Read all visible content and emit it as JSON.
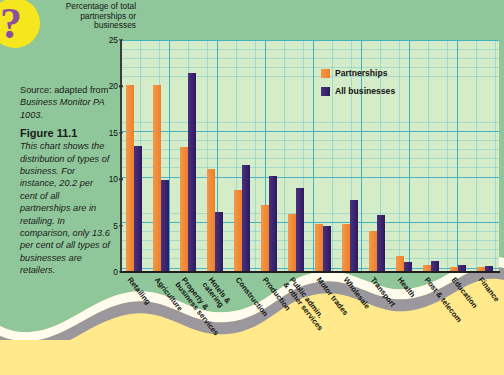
{
  "axis_title": "Percentage\nof total\npartnerships\nor businesses",
  "source": {
    "prefix": "Source: adapted from ",
    "italic": "Business Monitor PA 1003."
  },
  "figure": {
    "title": "Figure 11.1",
    "body": "This chart shows the distribution of types of business. For instance, 20.2 per cent of all partnerships are in retailing. In comparison, only 13.6 per cent of all types of businesses are retailers."
  },
  "legend": {
    "partnerships": "Partnerships",
    "all_businesses": "All businesses",
    "position": "top-center"
  },
  "colors": {
    "partnerships": "#ef7f2a",
    "all_businesses": "#2d1a5e",
    "page_green": "#8fc79a",
    "page_yellow": "#ffe98a",
    "plot_bg": "#d5ecc8",
    "gridline": "#32aac3",
    "badge_yellow": "#f5e61e",
    "badge_purple": "#8a4f9e"
  },
  "icons": {
    "question_mark": "?"
  },
  "chart_data": {
    "type": "bar",
    "title": "Figure 11.1",
    "xlabel": "",
    "ylabel": "Percentage of total partnerships or businesses",
    "ylim": [
      0,
      25
    ],
    "yticks": [
      0,
      5,
      10,
      15,
      20,
      25
    ],
    "grid": true,
    "legend_position": "top-center",
    "categories": [
      "Retailing",
      "Agriculture",
      "Property &\nbusiness services",
      "Hotels &\ncatering",
      "Construction",
      "Production",
      "Public admin.\n& other services",
      "Motor trades",
      "Wholesale",
      "Transport",
      "Health",
      "Post & telecom",
      "Education",
      "Finance"
    ],
    "series": [
      {
        "name": "Partnerships",
        "color": "#ef7f2a",
        "values": [
          20.2,
          20.1,
          13.5,
          11.1,
          8.8,
          7.2,
          6.2,
          5.2,
          5.2,
          4.4,
          1.7,
          0.8,
          0.5,
          0.5
        ]
      },
      {
        "name": "All businesses",
        "color": "#2d1a5e",
        "values": [
          13.6,
          9.9,
          21.4,
          6.5,
          11.5,
          10.3,
          9.0,
          5.0,
          7.8,
          6.1,
          1.1,
          1.2,
          0.8,
          0.7
        ]
      }
    ]
  }
}
